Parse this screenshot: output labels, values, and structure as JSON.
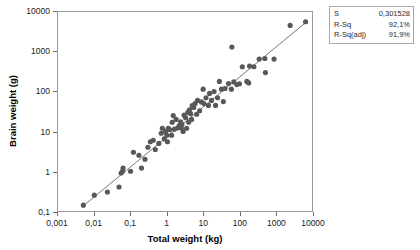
{
  "chart_data": {
    "type": "scatter",
    "title": "",
    "xlabel": "Total weight (kg)",
    "ylabel": "Brain weight (g)",
    "xscale": "log",
    "yscale": "log",
    "xlim": [
      0.001,
      10000
    ],
    "ylim": [
      0.1,
      10000
    ],
    "grid": false,
    "legend": "none",
    "xticks": [
      "0,001",
      "0,01",
      "0,1",
      "1",
      "10",
      "100",
      "1000",
      "10000"
    ],
    "xtick_values": [
      0.001,
      0.01,
      0.1,
      1,
      10,
      100,
      1000,
      10000
    ],
    "yticks": [
      "10000",
      "1000",
      "100",
      "10",
      "1",
      "0,1"
    ],
    "ytick_values": [
      10000,
      1000,
      100,
      10,
      1,
      0.1
    ],
    "marker": {
      "shape": "circle",
      "color": "#585858",
      "size": 4
    },
    "series": [
      {
        "name": "Brain weight vs Total weight",
        "points": [
          [
            0.005,
            0.14
          ],
          [
            0.01,
            0.25
          ],
          [
            0.023,
            0.3
          ],
          [
            0.048,
            0.4
          ],
          [
            0.055,
            0.9
          ],
          [
            0.06,
            1.0
          ],
          [
            0.062,
            1.2
          ],
          [
            0.1,
            1.0
          ],
          [
            0.12,
            3.0
          ],
          [
            0.17,
            2.5
          ],
          [
            0.2,
            1.2
          ],
          [
            0.25,
            2.0
          ],
          [
            0.3,
            4.0
          ],
          [
            0.35,
            5.5
          ],
          [
            0.42,
            6.0
          ],
          [
            0.48,
            3.5
          ],
          [
            0.6,
            5.0
          ],
          [
            0.7,
            9.0
          ],
          [
            0.75,
            12.0
          ],
          [
            0.85,
            6.5
          ],
          [
            0.92,
            10.0
          ],
          [
            1.0,
            8.0
          ],
          [
            1.04,
            5.5
          ],
          [
            1.1,
            12.0
          ],
          [
            1.2,
            11.0
          ],
          [
            1.35,
            8.0
          ],
          [
            1.4,
            17.0
          ],
          [
            1.5,
            25.0
          ],
          [
            1.62,
            11.4
          ],
          [
            1.8,
            20.0
          ],
          [
            2.0,
            12.3
          ],
          [
            2.2,
            14.0
          ],
          [
            2.4,
            17.5
          ],
          [
            2.5,
            12.1
          ],
          [
            2.6,
            15.0
          ],
          [
            2.8,
            10.0
          ],
          [
            3.0,
            25.6
          ],
          [
            3.3,
            22.0
          ],
          [
            3.5,
            12.0
          ],
          [
            3.8,
            30.0
          ],
          [
            4.0,
            17.0
          ],
          [
            4.2,
            35.0
          ],
          [
            4.5,
            28.0
          ],
          [
            4.8,
            20.0
          ],
          [
            5.0,
            44.5
          ],
          [
            5.5,
            40.0
          ],
          [
            6.0,
            50.0
          ],
          [
            6.6,
            27.0
          ],
          [
            7.0,
            60.0
          ],
          [
            8.0,
            33.0
          ],
          [
            9.0,
            55.0
          ],
          [
            10.0,
            115.0
          ],
          [
            10.5,
            50.0
          ],
          [
            12.0,
            70.0
          ],
          [
            14.0,
            45.0
          ],
          [
            15.0,
            90.0
          ],
          [
            17.0,
            60.0
          ],
          [
            20.0,
            100.0
          ],
          [
            22.0,
            45.0
          ],
          [
            25.0,
            70.0
          ],
          [
            28.0,
            180.0
          ],
          [
            32.0,
            115.0
          ],
          [
            36.0,
            56.0
          ],
          [
            40.0,
            120.0
          ],
          [
            50.0,
            160.0
          ],
          [
            60.0,
            115.0
          ],
          [
            62.0,
            1320.0
          ],
          [
            70.0,
            175.0
          ],
          [
            85.0,
            150.0
          ],
          [
            100.0,
            157.0
          ],
          [
            120.0,
            420.0
          ],
          [
            160.0,
            180.0
          ],
          [
            180.0,
            165.0
          ],
          [
            190.0,
            440.0
          ],
          [
            250.0,
            420.0
          ],
          [
            350.0,
            655.0
          ],
          [
            500.0,
            680.0
          ],
          [
            520.0,
            300.0
          ],
          [
            900.0,
            655.0
          ],
          [
            2500.0,
            4600.0
          ],
          [
            6650.0,
            5700.0
          ]
        ]
      }
    ],
    "fit_line": {
      "type": "linear-on-log",
      "visible": true,
      "color": "#666666",
      "x_start": 0.005,
      "y_start": 0.135,
      "x_end": 6650.0,
      "y_end": 5400.0
    }
  },
  "axes": {
    "x": {
      "title": "Total weight (kg)",
      "ticks": [
        "0,001",
        "0,01",
        "0,1",
        "1",
        "10",
        "100",
        "1000",
        "10000"
      ]
    },
    "y": {
      "title": "Brain weight (g)",
      "ticks": [
        "10000",
        "1000",
        "100",
        "10",
        "1",
        "0,1"
      ]
    }
  },
  "stats_box": {
    "rows": [
      {
        "key": "S",
        "value": "0,301528"
      },
      {
        "key": "R-Sq",
        "value": "92,1%"
      },
      {
        "key": "R-Sq(adj)",
        "value": "91,9%"
      }
    ]
  },
  "colors": {
    "marker": "#585858",
    "fit_line": "#666666",
    "frame": "#9a9a9a",
    "text": "#1a1a1a",
    "background": "#ffffff"
  }
}
